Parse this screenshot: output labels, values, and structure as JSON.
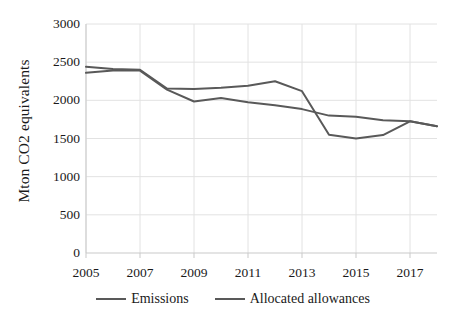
{
  "chart_data": {
    "type": "line",
    "title": "",
    "xlabel": "",
    "ylabel": "Mton CO2 equivalents",
    "x": [
      2005,
      2006,
      2007,
      2008,
      2009,
      2010,
      2011,
      2012,
      2013,
      2014,
      2015,
      2016,
      2017,
      2018
    ],
    "xlim": [
      2005,
      2018
    ],
    "ylim": [
      0,
      3000
    ],
    "xtick_labels": [
      "2005",
      "2007",
      "2009",
      "2011",
      "2013",
      "2015",
      "2017"
    ],
    "xtick_values": [
      2005,
      2007,
      2009,
      2011,
      2013,
      2015,
      2017
    ],
    "ytick_labels": [
      "0",
      "500",
      "1000",
      "1500",
      "2000",
      "2500",
      "3000"
    ],
    "ytick_values": [
      0,
      500,
      1000,
      1500,
      2000,
      2500,
      3000
    ],
    "grid": true,
    "legend_position": "bottom",
    "series": [
      {
        "name": "Emissions",
        "color": "#595959",
        "values": [
          2360,
          2390,
          2390,
          2140,
          1985,
          2030,
          1975,
          1935,
          1885,
          1800,
          1785,
          1740,
          1725,
          1660
        ]
      },
      {
        "name": "Allocated allowances",
        "color": "#595959",
        "values": [
          2440,
          2410,
          2400,
          2155,
          2150,
          2165,
          2190,
          2250,
          2120,
          1550,
          1500,
          1545,
          1725,
          1660
        ]
      }
    ]
  },
  "legend": {
    "items": [
      {
        "label": "Emissions",
        "color": "#595959"
      },
      {
        "label": "Allocated allowances",
        "color": "#595959"
      }
    ]
  },
  "axes": {
    "y_axis_title": "Mton CO2 equivalents"
  },
  "style": {
    "line_color": "#595959",
    "grid_color": "#e2e2e2",
    "axis_color": "#c9c9c9",
    "text_color": "#1a1a1a",
    "background": "#ffffff"
  }
}
